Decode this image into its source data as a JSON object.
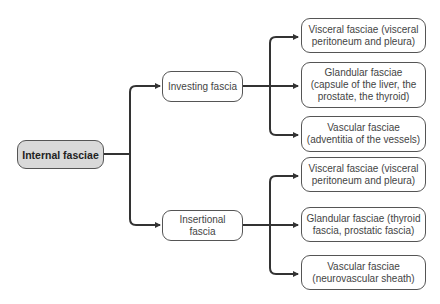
{
  "diagram": {
    "root": {
      "label": "Internal fasciae"
    },
    "branches": [
      {
        "label": "Investing fascia",
        "children": [
          {
            "label": "Visceral fasciae (visceral peritoneum and pleura)"
          },
          {
            "label": "Glandular fasciae (capsule of the liver, the prostate, the thyroid)"
          },
          {
            "label": "Vascular fasciae (adventitia of the vessels)"
          }
        ]
      },
      {
        "label": "Insertional fascia",
        "children": [
          {
            "label": "Visceral fasciae (visceral peritoneum and pleura)"
          },
          {
            "label": "Glandular fasciae (thyroid fascia, prostatic fascia)"
          },
          {
            "label": "Vascular fasciae (neurovascular sheath)"
          }
        ]
      }
    ],
    "colors": {
      "line": "#333333",
      "root_fill": "#d9d9d9",
      "border": "#555555"
    }
  }
}
